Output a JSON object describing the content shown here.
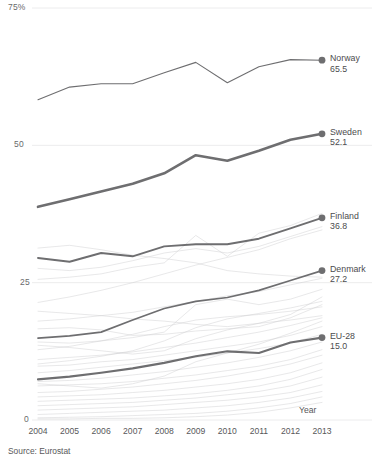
{
  "chart_data": {
    "type": "line",
    "title": "",
    "subtitle": "",
    "xlabel": "Year",
    "ylabel": "",
    "ylim": [
      0,
      75
    ],
    "xlim": [
      2004,
      2013
    ],
    "grid": true,
    "legend_position": "right-endpoint-labels",
    "source": "Source: Eurostat",
    "yticks": [
      {
        "value": 75,
        "label": "75%"
      },
      {
        "value": 50,
        "label": "50"
      },
      {
        "value": 25,
        "label": "25"
      },
      {
        "value": 0,
        "label": "0"
      }
    ],
    "x": [
      2004,
      2005,
      2006,
      2007,
      2008,
      2009,
      2010,
      2011,
      2012,
      2013
    ],
    "xticks": [
      "2004",
      "2005",
      "2006",
      "2007",
      "2008",
      "2009",
      "2010",
      "2011",
      "2012",
      "2013"
    ],
    "highlight_color": "#6e6e70",
    "background_color": "#c9c9cb",
    "series": [
      {
        "name": "Norway",
        "end_label": "Norway",
        "end_value": "65.5",
        "highlight": true,
        "width": 1.1,
        "values": [
          58.3,
          60.6,
          61.2,
          61.2,
          63.2,
          65.1,
          61.4,
          64.3,
          65.6,
          65.5
        ]
      },
      {
        "name": "Sweden",
        "end_label": "Sweden",
        "end_value": "52.1",
        "highlight": true,
        "width": 2.6,
        "values": [
          38.8,
          40.2,
          41.6,
          43.0,
          44.9,
          48.2,
          47.2,
          49.0,
          51.0,
          52.1
        ]
      },
      {
        "name": "Finland",
        "end_label": "Finland",
        "end_value": "36.8",
        "highlight": true,
        "width": 1.9,
        "values": [
          29.5,
          28.8,
          30.4,
          29.8,
          31.6,
          32.0,
          32.0,
          33.0,
          34.9,
          36.8
        ]
      },
      {
        "name": "Denmark",
        "end_label": "Denmark",
        "end_value": "27.2",
        "highlight": true,
        "width": 1.7,
        "values": [
          14.9,
          15.3,
          16.0,
          18.2,
          20.3,
          21.6,
          22.3,
          23.6,
          25.4,
          27.2
        ]
      },
      {
        "name": "EU-28",
        "end_label": "EU-28",
        "end_value": "15.0",
        "highlight": true,
        "width": 2.1,
        "values": [
          7.4,
          7.9,
          8.6,
          9.4,
          10.4,
          11.6,
          12.5,
          12.2,
          14.1,
          15.0
        ]
      },
      {
        "name": "other-1",
        "highlight": false,
        "width": 0.7,
        "values": [
          31.3,
          31.8,
          31.0,
          30.0,
          29.4,
          28.6,
          27.2,
          26.6,
          26.2,
          26.0
        ]
      },
      {
        "name": "other-2",
        "highlight": false,
        "width": 0.7,
        "values": [
          25.6,
          26.0,
          26.6,
          27.8,
          28.6,
          33.6,
          29.8,
          34.0,
          35.4,
          37.6
        ]
      },
      {
        "name": "other-3",
        "highlight": false,
        "width": 0.7,
        "values": [
          21.4,
          22.4,
          23.6,
          25.0,
          26.6,
          28.2,
          29.6,
          31.0,
          33.0,
          34.6
        ]
      },
      {
        "name": "other-4",
        "highlight": false,
        "width": 0.7,
        "values": [
          18.0,
          18.4,
          19.0,
          19.6,
          20.6,
          21.6,
          22.6,
          23.4,
          24.6,
          25.8
        ]
      },
      {
        "name": "other-5",
        "highlight": false,
        "width": 0.7,
        "values": [
          14.2,
          14.0,
          14.4,
          15.0,
          16.0,
          21.0,
          22.0,
          21.0,
          22.0,
          23.8
        ]
      },
      {
        "name": "other-6",
        "highlight": false,
        "width": 0.7,
        "values": [
          16.6,
          16.8,
          16.4,
          15.4,
          15.6,
          16.2,
          16.6,
          17.0,
          18.6,
          21.0
        ]
      },
      {
        "name": "other-7",
        "highlight": false,
        "width": 0.7,
        "values": [
          12.8,
          13.4,
          14.4,
          15.6,
          17.0,
          18.2,
          18.8,
          19.2,
          19.8,
          20.6
        ]
      },
      {
        "name": "other-8",
        "highlight": false,
        "width": 0.7,
        "values": [
          11.0,
          11.4,
          11.8,
          12.4,
          13.2,
          14.0,
          15.0,
          16.0,
          17.2,
          18.6
        ]
      },
      {
        "name": "other-9",
        "highlight": false,
        "width": 0.7,
        "values": [
          9.8,
          10.0,
          10.6,
          11.0,
          11.8,
          12.6,
          13.4,
          14.2,
          15.4,
          17.0
        ]
      },
      {
        "name": "other-10",
        "highlight": false,
        "width": 0.7,
        "values": [
          8.6,
          9.0,
          9.6,
          10.2,
          10.8,
          11.4,
          12.2,
          13.0,
          14.0,
          15.6
        ]
      },
      {
        "name": "other-11",
        "highlight": false,
        "width": 0.7,
        "values": [
          7.0,
          7.2,
          7.6,
          8.2,
          8.8,
          9.6,
          10.4,
          11.4,
          12.6,
          14.2
        ]
      },
      {
        "name": "other-12",
        "highlight": false,
        "width": 0.7,
        "values": [
          6.2,
          6.4,
          6.6,
          7.0,
          7.6,
          8.2,
          9.0,
          9.8,
          11.0,
          12.8
        ]
      },
      {
        "name": "other-13",
        "highlight": false,
        "width": 0.7,
        "values": [
          5.0,
          5.2,
          5.6,
          6.0,
          6.6,
          7.2,
          8.0,
          9.0,
          10.2,
          11.8
        ]
      },
      {
        "name": "other-14",
        "highlight": false,
        "width": 0.7,
        "values": [
          4.2,
          4.4,
          4.6,
          5.0,
          5.4,
          6.0,
          6.6,
          7.4,
          8.6,
          10.4
        ]
      },
      {
        "name": "other-15",
        "highlight": false,
        "width": 0.7,
        "values": [
          3.4,
          3.6,
          3.8,
          4.0,
          4.4,
          4.8,
          5.4,
          6.2,
          7.4,
          9.2
        ]
      },
      {
        "name": "other-16",
        "highlight": false,
        "width": 0.7,
        "values": [
          2.6,
          2.8,
          3.0,
          3.2,
          3.6,
          4.0,
          4.6,
          5.2,
          6.2,
          7.8
        ]
      },
      {
        "name": "other-17",
        "highlight": false,
        "width": 0.7,
        "values": [
          1.8,
          2.0,
          2.2,
          2.4,
          2.8,
          3.2,
          3.6,
          4.2,
          5.0,
          6.4
        ]
      },
      {
        "name": "other-18",
        "highlight": false,
        "width": 0.7,
        "values": [
          1.0,
          1.2,
          1.4,
          1.6,
          1.8,
          2.2,
          2.6,
          3.2,
          4.0,
          5.2
        ]
      },
      {
        "name": "other-19",
        "highlight": false,
        "width": 0.7,
        "values": [
          0.4,
          0.5,
          0.6,
          0.8,
          1.0,
          1.2,
          1.6,
          2.2,
          3.0,
          4.2
        ]
      },
      {
        "name": "other-20",
        "highlight": false,
        "width": 0.7,
        "values": [
          0.2,
          0.2,
          0.3,
          0.3,
          0.4,
          0.6,
          0.9,
          1.4,
          2.2,
          3.2
        ]
      },
      {
        "name": "other-21",
        "highlight": false,
        "width": 0.7,
        "values": [
          13.6,
          13.2,
          12.6,
          12.0,
          12.6,
          14.8,
          16.4,
          17.6,
          19.2,
          22.4
        ]
      },
      {
        "name": "other-22",
        "highlight": false,
        "width": 0.7,
        "values": [
          19.8,
          19.4,
          19.0,
          18.4,
          18.0,
          17.4,
          17.0,
          17.6,
          18.2,
          19.0
        ]
      },
      {
        "name": "other-23",
        "highlight": false,
        "width": 0.7,
        "values": [
          10.2,
          10.8,
          11.6,
          12.6,
          14.4,
          16.8,
          18.4,
          19.4,
          20.4,
          21.6
        ]
      },
      {
        "name": "other-24",
        "highlight": false,
        "width": 0.7,
        "values": [
          6.6,
          6.2,
          5.8,
          6.6,
          8.0,
          10.6,
          12.2,
          13.8,
          15.8,
          18.0
        ]
      },
      {
        "name": "other-25",
        "highlight": false,
        "width": 0.7,
        "values": [
          27.6,
          27.2,
          27.8,
          29.0,
          30.4,
          31.2,
          30.4,
          31.6,
          33.4,
          35.2
        ]
      }
    ]
  }
}
